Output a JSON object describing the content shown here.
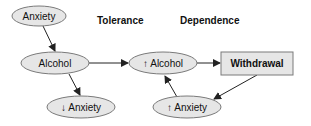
{
  "diagram": {
    "headings": {
      "tolerance": "Tolerance",
      "dependence": "Dependence"
    },
    "nodes": {
      "anxiety": "Anxiety",
      "alcohol": "Alcohol",
      "decreased_anxiety": "↓ Anxiety",
      "increased_alcohol": "↑ Alcohol",
      "withdrawal": "Withdrawal",
      "increased_anxiety": "↑ Anxiety"
    },
    "edges": [
      {
        "from": "Anxiety",
        "to": "Alcohol"
      },
      {
        "from": "Alcohol",
        "to": "↓ Anxiety"
      },
      {
        "from": "Alcohol",
        "to": "↑ Alcohol"
      },
      {
        "from": "↑ Alcohol",
        "to": "Withdrawal"
      },
      {
        "from": "Withdrawal",
        "to": "↑ Anxiety"
      },
      {
        "from": "↑ Anxiety",
        "to": "↑ Alcohol"
      }
    ],
    "colors": {
      "node_fill": "#e6e6e6",
      "node_stroke": "#7a7a7a",
      "edge": "#222222"
    }
  }
}
